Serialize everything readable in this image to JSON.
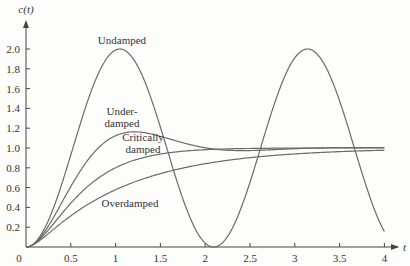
{
  "chart_data": {
    "type": "line",
    "title": "",
    "xlabel": "t",
    "ylabel": "c(t)",
    "xlim": [
      0,
      4
    ],
    "ylim": [
      0,
      2.0
    ],
    "grid": false,
    "x_ticks": [
      "0",
      "0.5",
      "1",
      "1.5",
      "2",
      "2.5",
      "3",
      "3.5",
      "4"
    ],
    "y_ticks": [
      "0.2",
      "0.4",
      "0.6",
      "0.8",
      "1.0",
      "1.2",
      "1.4",
      "1.6",
      "1.8",
      "2.0"
    ],
    "series": [
      {
        "name": "Undamped",
        "label_lines": [
          "Undamped"
        ],
        "zeta": 0.0,
        "wn": 3.0,
        "description": "oscillates 0 to 2.0, peaks near t=1.05 and t=3.15, minimum near t=2.1"
      },
      {
        "name": "Underdamped",
        "label_lines": [
          "Under-",
          "damped"
        ],
        "zeta": 0.5,
        "wn": 3.0,
        "description": "peak ~1.16 near t=1.2, settles to 1.0"
      },
      {
        "name": "Critically damped",
        "label_lines": [
          "Critically",
          "damped"
        ],
        "zeta": 1.0,
        "wn": 3.0,
        "description": "rises monotonically to ~1.0"
      },
      {
        "name": "Overdamped",
        "label_lines": [
          "Overdamped"
        ],
        "zeta": 1.7,
        "wn": 3.0,
        "description": "rises slowly to ~1.0"
      }
    ],
    "sample_points": {
      "t": [
        0,
        0.5,
        1.0,
        1.5,
        2.0,
        2.5,
        3.0,
        3.5,
        4.0
      ],
      "Undamped": [
        0,
        0.93,
        1.99,
        1.21,
        0.04,
        1.35,
        1.91,
        0.52,
        0.16
      ],
      "Underdamped": [
        0,
        0.58,
        1.12,
        1.12,
        1.01,
        0.99,
        1.0,
        1.0,
        1.0
      ],
      "Critically damped": [
        0,
        0.44,
        0.8,
        0.94,
        0.98,
        0.99,
        1.0,
        1.0,
        1.0
      ],
      "Overdamped": [
        0,
        0.33,
        0.62,
        0.79,
        0.88,
        0.93,
        0.96,
        0.98,
        0.99
      ]
    },
    "legend_position": "inline labels near curves"
  },
  "colors": {
    "curve": "#6a6a6a",
    "axis": "#444444",
    "text": "#333333"
  }
}
